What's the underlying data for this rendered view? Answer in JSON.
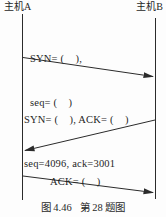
{
  "diagram": {
    "title_caption": "图 4.46   第 28 题图",
    "hosts": {
      "a": "主机A",
      "b": "主机B"
    },
    "messages": [
      {
        "id": "syn",
        "direction": "a-to-b",
        "line1": "SYN= (    ),",
        "line2": "seq= (    )"
      },
      {
        "id": "syn-ack",
        "direction": "b-to-a",
        "line1": "SYN= (    ), ACK= (    )",
        "line2": "seq=4096, ack=3001"
      },
      {
        "id": "ack",
        "direction": "a-to-b",
        "line1": "ACK= (    )",
        "line2": "ack= (    )"
      }
    ],
    "values_shown": {
      "seq": 4096,
      "ack": 3001
    },
    "colors": {
      "line": "#2b2b2b",
      "text": "#1f1f1f",
      "background": "#fdfdfd"
    }
  }
}
